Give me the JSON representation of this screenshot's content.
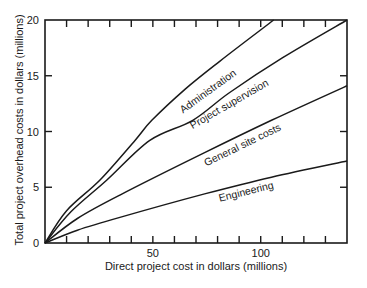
{
  "chart_data": {
    "type": "line",
    "title": "",
    "xlabel": "Direct project cost in dollars (millions)",
    "ylabel": "Total project overhead costs in dollars (millions)",
    "xlim": [
      0,
      140
    ],
    "ylim": [
      0,
      20
    ],
    "grid": false,
    "legend": "inline labels on curves",
    "x_ticks": [
      0,
      10,
      20,
      30,
      40,
      50,
      60,
      70,
      80,
      90,
      100,
      110,
      120,
      130
    ],
    "x_tick_labels": [
      {
        "value": 50,
        "label": "50"
      },
      {
        "value": 100,
        "label": "100"
      }
    ],
    "y_ticks": [
      0,
      5,
      10,
      15,
      20
    ],
    "y_tick_labels": [
      {
        "value": 0,
        "label": "0"
      },
      {
        "value": 5,
        "label": "5"
      },
      {
        "value": 10,
        "label": "10"
      },
      {
        "value": 15,
        "label": "15"
      },
      {
        "value": 20,
        "label": "20"
      }
    ],
    "series": [
      {
        "name": "Administration",
        "points": [
          [
            0,
            0
          ],
          [
            10,
            2.9
          ],
          [
            25.5,
            5.65
          ],
          [
            41.7,
            9.2
          ],
          [
            49.5,
            11.0
          ],
          [
            65,
            13.8
          ],
          [
            81,
            16.3
          ],
          [
            106,
            20
          ]
        ],
        "label_pos": {
          "x": 210,
          "y": 94,
          "angle": -36
        }
      },
      {
        "name": "Project supervision",
        "points": [
          [
            0,
            0
          ],
          [
            12,
            2.8
          ],
          [
            28.7,
            5.65
          ],
          [
            48.6,
            9.2
          ],
          [
            68.5,
            11.0
          ],
          [
            85.6,
            13.5
          ],
          [
            110,
            16.6
          ],
          [
            140,
            20
          ]
        ],
        "label_pos": {
          "x": 231,
          "y": 107,
          "angle": -30
        }
      },
      {
        "name": "General site costs",
        "points": [
          [
            0,
            0
          ],
          [
            15,
            2.2
          ],
          [
            34.7,
            4.3
          ],
          [
            74,
            8.1
          ],
          [
            105,
            11.0
          ],
          [
            140,
            14.1
          ]
        ],
        "label_pos": {
          "x": 244,
          "y": 148,
          "angle": -26
        }
      },
      {
        "name": "Engineering",
        "points": [
          [
            0,
            0
          ],
          [
            15,
            1.15
          ],
          [
            34.7,
            2.3
          ],
          [
            74,
            4.4
          ],
          [
            105,
            5.9
          ],
          [
            140,
            7.35
          ]
        ],
        "label_pos": {
          "x": 247,
          "y": 195,
          "angle": -14
        }
      }
    ]
  }
}
